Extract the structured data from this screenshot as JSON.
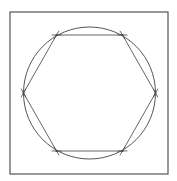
{
  "diagram": {
    "title": "",
    "colors": {
      "background": "#ffffff",
      "frame": "#333333",
      "circle": "#555555",
      "hexagon": "#666666",
      "marks": "#444444"
    },
    "frame": {
      "x": 10,
      "y": 12,
      "width": 158,
      "height": 162
    },
    "circle": {
      "cx": 89.5,
      "cy": 93,
      "r": 66
    },
    "hexagon": {
      "vertices": [
        {
          "x": 56.5,
          "y": 35
        },
        {
          "x": 122.5,
          "y": 35
        },
        {
          "x": 155.5,
          "y": 93
        },
        {
          "x": 122.5,
          "y": 151
        },
        {
          "x": 56.5,
          "y": 151
        },
        {
          "x": 23.5,
          "y": 93
        }
      ]
    },
    "labels": []
  }
}
